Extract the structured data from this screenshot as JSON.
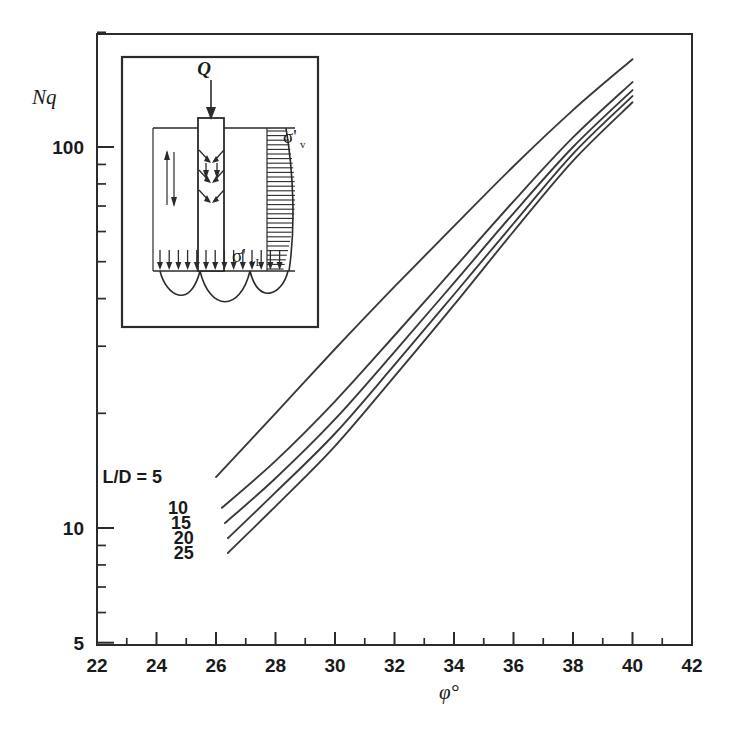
{
  "chart_data": {
    "type": "line",
    "title": "",
    "xlabel": "φ°",
    "ylabel": "Nq",
    "xscale": "linear",
    "yscale": "log",
    "xlim": [
      22,
      42
    ],
    "ylim": [
      5,
      200
    ],
    "grid": false,
    "legend_position": "inline-left-labels",
    "xticks": [
      22,
      24,
      26,
      28,
      30,
      32,
      34,
      36,
      38,
      40,
      42
    ],
    "xtick_labels": [
      "22",
      "24",
      "26",
      "28",
      "30",
      "32",
      "34",
      "36",
      "38",
      "40",
      "42"
    ],
    "xminor_ticks": [
      23,
      25,
      27,
      29,
      31,
      33,
      35,
      37,
      39,
      41
    ],
    "yticks": [
      5,
      10,
      100
    ],
    "ytick_labels": [
      "5",
      "10",
      "100"
    ],
    "yminor_ticks": [
      6,
      7,
      8,
      9,
      20,
      30,
      40,
      50,
      60,
      70,
      80,
      90,
      200
    ],
    "series": [
      {
        "name": "L/D = 5",
        "label": "L/D = 5",
        "x": [
          26.0,
          28.0,
          30.0,
          32.0,
          34.0,
          36.0,
          38.0,
          40.0
        ],
        "y": [
          13.6,
          20.0,
          29.5,
          43.0,
          62.0,
          89.0,
          125.0,
          170.0
        ]
      },
      {
        "name": "L/D = 10",
        "label": "10",
        "x": [
          26.2,
          28.0,
          30.0,
          32.0,
          34.0,
          36.0,
          38.0,
          40.0
        ],
        "y": [
          11.3,
          15.0,
          21.5,
          32.0,
          48.0,
          72.0,
          106.0,
          148.0
        ]
      },
      {
        "name": "L/D = 15",
        "label": "15",
        "x": [
          26.3,
          28.0,
          30.0,
          32.0,
          34.0,
          36.0,
          38.0,
          40.0
        ],
        "y": [
          10.3,
          13.5,
          19.3,
          29.0,
          44.0,
          67.0,
          100.0,
          141.0
        ]
      },
      {
        "name": "L/D = 20",
        "label": "20",
        "x": [
          26.4,
          28.0,
          30.0,
          32.0,
          34.0,
          36.0,
          38.0,
          40.0
        ],
        "y": [
          9.4,
          12.4,
          17.7,
          26.8,
          41.0,
          63.0,
          96.0,
          136.0
        ]
      },
      {
        "name": "L/D = 25",
        "label": "25",
        "x": [
          26.4,
          28.0,
          30.0,
          32.0,
          34.0,
          36.0,
          38.0,
          40.0
        ],
        "y": [
          8.6,
          11.4,
          16.4,
          25.0,
          38.5,
          60.0,
          92.0,
          131.0
        ]
      }
    ]
  },
  "inset": {
    "load_label": "Q",
    "stress_top_label": "σ'",
    "stress_top_sub": "v",
    "stress_base_label": "σ'",
    "stress_base_sub": "vL"
  }
}
